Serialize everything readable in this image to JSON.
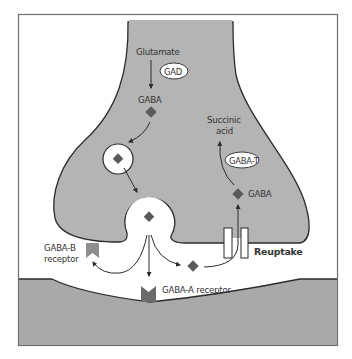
{
  "figure": {
    "type": "synapse-diagram",
    "colors": {
      "frame": "#6e6e6e",
      "neuron_fill": "#b4b4b4",
      "postsynaptic_fill": "#a9a9a9",
      "outline": "#2b2b2b",
      "molecule": "#5a5a5a",
      "gaba_a_receptor": "#6b6b6b",
      "gaba_b_receptor": "#8e8e8e",
      "text": "#333333"
    }
  },
  "labels": {
    "glutamate": "Glutamate",
    "gad": "GAD",
    "gaba_top": "GABA",
    "succinic_line1": "Succinic",
    "succinic_line2": "acid",
    "gaba_t": "GABA-T",
    "gaba_right": "GABA",
    "gaba_b_line1": "GABA-B",
    "gaba_b_line2": "receptor",
    "reuptake": "Reuptake",
    "gaba_a": "GABA-A receptor"
  }
}
